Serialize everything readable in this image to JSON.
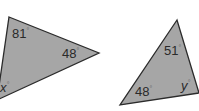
{
  "colors": {
    "fill": "#a6a6a6",
    "stroke": "#2b2b2b",
    "text": "#2a2a2a",
    "background": "#ffffff"
  },
  "triangles": [
    {
      "name": "triangle-left",
      "points": "9,17 99,53 -3,100",
      "angles": [
        {
          "value": "81",
          "symbol": "°",
          "x": 12,
          "y": 38,
          "italic": false
        },
        {
          "value": "48",
          "symbol": "°",
          "x": 62,
          "y": 58,
          "italic": false
        },
        {
          "value": "x",
          "symbol": "°",
          "x": 0,
          "y": 92,
          "italic": true
        }
      ]
    },
    {
      "name": "triangle-right",
      "points": "177,20 120,105 199,93",
      "angles": [
        {
          "value": "51",
          "symbol": "°",
          "x": 164,
          "y": 55,
          "italic": false
        },
        {
          "value": "48",
          "symbol": "°",
          "x": 135,
          "y": 96,
          "italic": false
        },
        {
          "value": "y",
          "symbol": "°",
          "x": 181,
          "y": 90,
          "italic": true
        }
      ]
    }
  ]
}
